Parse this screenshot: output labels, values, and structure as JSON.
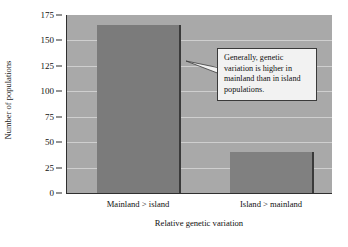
{
  "chart_data": {
    "type": "bar",
    "title": "",
    "xlabel": "Relative genetic variation",
    "ylabel": "Number of populations",
    "categories": [
      "Mainland > island",
      "Island > mainland"
    ],
    "values": [
      165,
      40
    ],
    "ylim": [
      0,
      175
    ],
    "ytick_values": [
      0,
      25,
      50,
      75,
      100,
      125,
      150,
      175
    ],
    "ytick_labels": [
      "0",
      "25",
      "50",
      "75",
      "100",
      "125",
      "150",
      "175"
    ],
    "grid": "horizontal",
    "legend": "none",
    "bar_color": "#7d7d7d",
    "plot_background": "#a9a9a9",
    "annotations": [
      {
        "name": "callout",
        "text": "Generally, genetic variation is higher in mainland than in island populations.",
        "points_to": "Mainland > island"
      }
    ]
  },
  "axis": {
    "y_title": "Number of populations",
    "x_title": "Relative genetic variation",
    "y_ticks": [
      {
        "label": "175",
        "value": 175
      },
      {
        "label": "150",
        "value": 150
      },
      {
        "label": "125",
        "value": 125
      },
      {
        "label": "100",
        "value": 100
      },
      {
        "label": "75",
        "value": 75
      },
      {
        "label": "50",
        "value": 50
      },
      {
        "label": "25",
        "value": 25
      },
      {
        "label": "0",
        "value": 0
      }
    ],
    "x_categories": [
      {
        "label": "Mainland > island"
      },
      {
        "label": "Island > mainland"
      }
    ]
  },
  "callout": {
    "text": "Generally, genetic variation is higher in mainland than in island populations."
  }
}
